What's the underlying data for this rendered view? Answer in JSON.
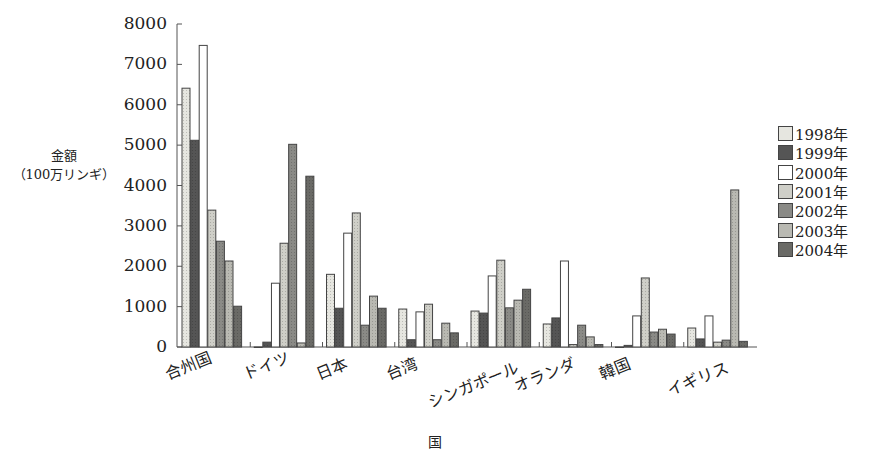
{
  "chart_data": {
    "type": "bar",
    "title": "",
    "xlabel": "国",
    "ylabel": "金額\n（100万リンギ）",
    "ylabel_lines": [
      "金額",
      "（100万リンギ）"
    ],
    "ylim": [
      0,
      8000
    ],
    "yticks": [
      0,
      1000,
      2000,
      3000,
      4000,
      5000,
      6000,
      7000,
      8000
    ],
    "grid": false,
    "legend_position": "right",
    "categories": [
      "合州国",
      "ドイツ",
      "日本",
      "台湾",
      "シンガポール",
      "オランダ",
      "韓国",
      "イギリス"
    ],
    "series": [
      {
        "name": "1998年",
        "color": "#e6e6e0",
        "values": [
          6410,
          0,
          1800,
          940,
          890,
          570,
          0,
          470
        ]
      },
      {
        "name": "1999年",
        "color": "#555555",
        "values": [
          5120,
          120,
          960,
          180,
          840,
          720,
          40,
          200
        ]
      },
      {
        "name": "2000年",
        "color": "#ffffff",
        "values": [
          7470,
          1580,
          2820,
          870,
          1760,
          2130,
          770,
          770
        ]
      },
      {
        "name": "2001年",
        "color": "#cfcfc8",
        "values": [
          3390,
          2570,
          3320,
          1060,
          2150,
          60,
          1710,
          120
        ]
      },
      {
        "name": "2002年",
        "color": "#8a8a86",
        "values": [
          2620,
          5020,
          540,
          180,
          970,
          540,
          370,
          170
        ]
      },
      {
        "name": "2003年",
        "color": "#b9b9b2",
        "values": [
          2130,
          100,
          1260,
          590,
          1160,
          250,
          440,
          3890
        ]
      },
      {
        "name": "2004年",
        "color": "#6a6a66",
        "values": [
          1010,
          4230,
          960,
          350,
          1430,
          60,
          320,
          140
        ]
      }
    ]
  }
}
